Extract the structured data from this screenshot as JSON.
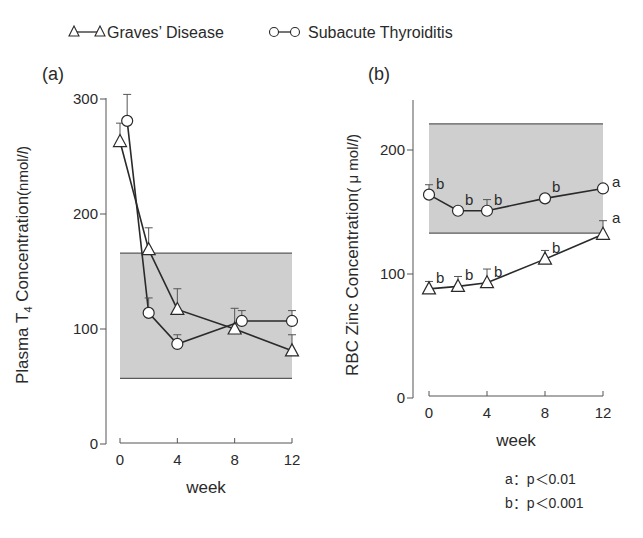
{
  "legend": {
    "items": [
      {
        "label": "Graves’ Disease",
        "marker": "triangle"
      },
      {
        "label": "Subacute Thyroiditis",
        "marker": "circle"
      }
    ]
  },
  "footnote": {
    "lines": [
      "a：p＜0.01",
      "b：p＜0.001"
    ]
  },
  "colors": {
    "line": "#2a2a2a",
    "shade": "#cfcfcf",
    "shade_edge": "#5a5a5a"
  },
  "chart_data": [
    {
      "type": "line",
      "panel_label": "(a)",
      "xlabel": "week",
      "ylabel": "Plasma T4 Concentration (nmol/l)",
      "ylabel_parts": {
        "pre": "Plasma T",
        "sub": "4",
        "post": " Concentration",
        "unit": "(nmol/",
        "unit_italic": "l",
        "unit_close": ")"
      },
      "xlim": [
        0,
        12
      ],
      "ylim": [
        0,
        300
      ],
      "xticks": [
        0,
        4,
        8,
        12
      ],
      "yticks": [
        0,
        100,
        200,
        300
      ],
      "grid": false,
      "normal_range": [
        57,
        166
      ],
      "series": [
        {
          "name": "Graves’ Disease",
          "marker": "triangle",
          "x": [
            0,
            2,
            4,
            8,
            12
          ],
          "y": [
            263,
            169,
            117,
            100,
            81
          ],
          "err_upper": [
            279,
            188,
            135,
            118,
            95
          ],
          "sig": [
            "",
            "",
            "",
            "",
            ""
          ]
        },
        {
          "name": "Subacute Thyroiditis",
          "marker": "circle",
          "x": [
            0.5,
            2,
            4,
            8.5,
            12
          ],
          "y": [
            281,
            114,
            87,
            107,
            107
          ],
          "err_upper": [
            304,
            127,
            95,
            116,
            116
          ],
          "sig": [
            "",
            "",
            "",
            "",
            ""
          ]
        }
      ]
    },
    {
      "type": "line",
      "panel_label": "(b)",
      "xlabel": "week",
      "ylabel": "RBC Zinc Concentration (μmol/l)",
      "ylabel_parts": {
        "pre": "RBC Zinc Concentration",
        "sub": "",
        "post": "",
        "unit": "( μ mol/",
        "unit_italic": "l",
        "unit_close": ")"
      },
      "xlim": [
        0,
        12
      ],
      "ylim": [
        0,
        240
      ],
      "xticks": [
        0,
        4,
        8,
        12
      ],
      "yticks": [
        0,
        100,
        200
      ],
      "grid": false,
      "normal_range": [
        133,
        221
      ],
      "series": [
        {
          "name": "Subacute Thyroiditis",
          "marker": "circle",
          "x": [
            0,
            2,
            4,
            8,
            12
          ],
          "y": [
            164,
            151,
            151,
            161,
            169
          ],
          "err_upper": [
            172,
            151,
            160,
            163,
            172
          ],
          "sig": [
            "b",
            "b",
            "b",
            "b",
            "a"
          ]
        },
        {
          "name": "Graves’ Disease",
          "marker": "triangle",
          "x": [
            0,
            2,
            4,
            8,
            12
          ],
          "y": [
            88,
            90,
            93,
            112,
            132
          ],
          "err_upper": [
            94,
            98,
            104,
            119,
            143
          ],
          "sig": [
            "b",
            "b",
            "b",
            "b",
            "a"
          ]
        }
      ]
    }
  ]
}
